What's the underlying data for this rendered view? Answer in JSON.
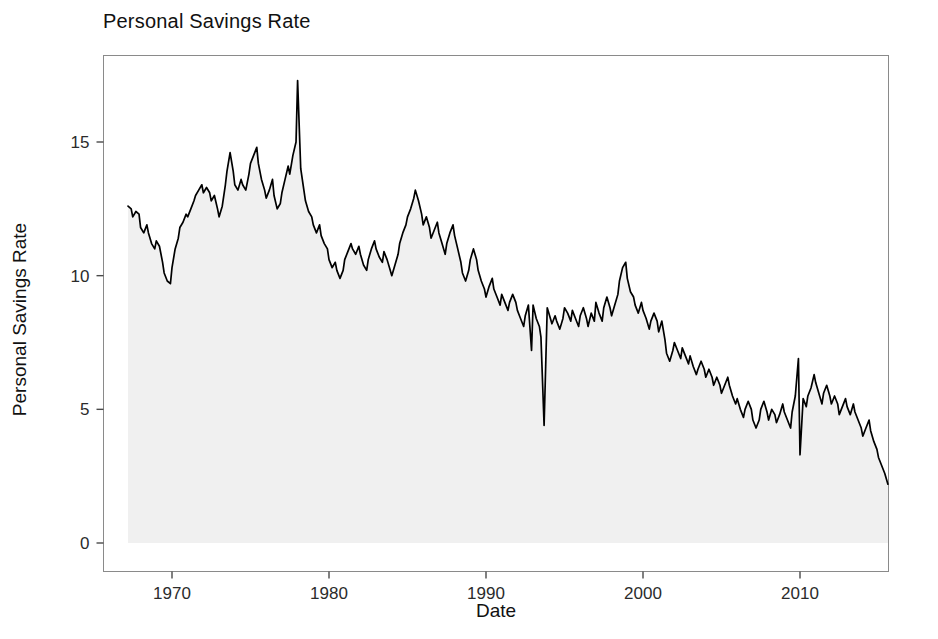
{
  "chart_data": {
    "type": "area",
    "title": "Personal Savings Rate",
    "xlabel": "Date",
    "ylabel": "Personal Savings Rate",
    "grid": false,
    "legend": null,
    "line_color": "#000000",
    "fill_color": "#f0f0f0",
    "xlim": [
      1966.0,
      2016.5
    ],
    "ylim": [
      0,
      17.8
    ],
    "xticks": [
      1970,
      1980,
      1990,
      2000,
      2010
    ],
    "xtick_labels": [
      "1970",
      "1980",
      "1990",
      "2000",
      "2010"
    ],
    "yticks": [
      0,
      5,
      10,
      15
    ],
    "ytick_labels": [
      "0",
      "5",
      "10",
      "15"
    ],
    "x_start": 1967.2,
    "x_end": 2015.6,
    "x": [
      1967.2,
      1967.4,
      1967.5,
      1967.7,
      1967.9,
      1968.0,
      1968.2,
      1968.4,
      1968.5,
      1968.7,
      1968.9,
      1969.0,
      1969.2,
      1969.4,
      1969.5,
      1969.7,
      1969.9,
      1970.0,
      1970.2,
      1970.4,
      1970.5,
      1970.7,
      1970.9,
      1971.0,
      1971.2,
      1971.4,
      1971.5,
      1971.7,
      1971.9,
      1972.0,
      1972.2,
      1972.4,
      1972.5,
      1972.7,
      1972.9,
      1973.0,
      1973.2,
      1973.4,
      1973.5,
      1973.7,
      1973.9,
      1974.0,
      1974.2,
      1974.4,
      1974.5,
      1974.7,
      1974.9,
      1975.0,
      1975.2,
      1975.4,
      1975.5,
      1975.7,
      1975.9,
      1976.0,
      1976.2,
      1976.4,
      1976.5,
      1976.7,
      1976.9,
      1977.0,
      1977.2,
      1977.4,
      1977.5,
      1977.7,
      1977.9,
      1978.0,
      1978.2,
      1978.4,
      1978.5,
      1978.7,
      1978.9,
      1979.0,
      1979.2,
      1979.4,
      1979.5,
      1979.7,
      1979.9,
      1980.0,
      1980.2,
      1980.4,
      1980.5,
      1980.7,
      1980.9,
      1981.0,
      1981.2,
      1981.4,
      1981.5,
      1981.7,
      1981.9,
      1982.0,
      1982.2,
      1982.4,
      1982.5,
      1982.7,
      1982.9,
      1983.0,
      1983.2,
      1983.4,
      1983.5,
      1983.7,
      1983.9,
      1984.0,
      1984.2,
      1984.4,
      1984.5,
      1984.7,
      1984.9,
      1985.0,
      1985.2,
      1985.4,
      1985.5,
      1985.7,
      1985.9,
      1986.0,
      1986.2,
      1986.4,
      1986.5,
      1986.7,
      1986.9,
      1987.0,
      1987.2,
      1987.4,
      1987.5,
      1987.7,
      1987.9,
      1988.0,
      1988.2,
      1988.4,
      1988.5,
      1988.7,
      1988.9,
      1989.0,
      1989.2,
      1989.4,
      1989.5,
      1989.7,
      1989.9,
      1990.0,
      1990.2,
      1990.4,
      1990.5,
      1990.7,
      1990.9,
      1991.0,
      1991.2,
      1991.4,
      1991.5,
      1991.7,
      1991.9,
      1992.0,
      1992.2,
      1992.4,
      1992.5,
      1992.7,
      1992.9,
      1993.0,
      1993.2,
      1993.4,
      1993.5,
      1993.7,
      1993.9,
      1994.0,
      1994.2,
      1994.4,
      1994.5,
      1994.7,
      1994.9,
      1995.0,
      1995.2,
      1995.4,
      1995.5,
      1995.7,
      1995.9,
      1996.0,
      1996.2,
      1996.4,
      1996.5,
      1996.7,
      1996.9,
      1997.0,
      1997.2,
      1997.4,
      1997.5,
      1997.7,
      1997.9,
      1998.0,
      1998.2,
      1998.4,
      1998.5,
      1998.7,
      1998.9,
      1999.0,
      1999.2,
      1999.4,
      1999.5,
      1999.7,
      1999.9,
      2000.0,
      2000.2,
      2000.4,
      2000.5,
      2000.7,
      2000.9,
      2001.0,
      2001.2,
      2001.4,
      2001.5,
      2001.7,
      2001.9,
      2002.0,
      2002.2,
      2002.4,
      2002.5,
      2002.7,
      2002.9,
      2003.0,
      2003.2,
      2003.4,
      2003.5,
      2003.7,
      2003.9,
      2004.0,
      2004.2,
      2004.4,
      2004.5,
      2004.7,
      2004.9,
      2005.0,
      2005.2,
      2005.4,
      2005.5,
      2005.7,
      2005.9,
      2006.0,
      2006.2,
      2006.4,
      2006.5,
      2006.7,
      2006.9,
      2007.0,
      2007.2,
      2007.4,
      2007.5,
      2007.7,
      2007.9,
      2008.0,
      2008.2,
      2008.4,
      2008.5,
      2008.7,
      2008.9,
      2009.0,
      2009.2,
      2009.4,
      2009.5,
      2009.7,
      2009.9,
      2010.0,
      2010.2,
      2010.4,
      2010.5,
      2010.7,
      2010.9,
      2011.0,
      2011.2,
      2011.4,
      2011.5,
      2011.7,
      2011.9,
      2012.0,
      2012.2,
      2012.4,
      2012.5,
      2012.7,
      2012.9,
      2013.0,
      2013.2,
      2013.4,
      2013.5,
      2013.7,
      2013.9,
      2014.0,
      2014.2,
      2014.4,
      2014.5,
      2014.7,
      2014.9,
      2015.0,
      2015.2,
      2015.4,
      2015.6
    ],
    "y": [
      12.6,
      12.5,
      12.2,
      12.4,
      12.3,
      11.8,
      11.6,
      11.9,
      11.6,
      11.2,
      11.0,
      11.3,
      11.1,
      10.5,
      10.1,
      9.8,
      9.7,
      10.3,
      11.0,
      11.4,
      11.8,
      12.0,
      12.3,
      12.2,
      12.5,
      12.8,
      13.0,
      13.2,
      13.4,
      13.1,
      13.3,
      13.1,
      12.8,
      13.0,
      12.5,
      12.2,
      12.6,
      13.4,
      13.9,
      14.6,
      13.9,
      13.4,
      13.2,
      13.6,
      13.4,
      13.2,
      13.8,
      14.2,
      14.5,
      14.8,
      14.2,
      13.6,
      13.2,
      12.9,
      13.2,
      13.6,
      13.0,
      12.5,
      12.7,
      13.1,
      13.6,
      14.1,
      13.8,
      14.5,
      15.0,
      17.3,
      14.0,
      13.2,
      12.8,
      12.4,
      12.2,
      11.9,
      11.6,
      11.9,
      11.5,
      11.2,
      11.0,
      10.6,
      10.3,
      10.5,
      10.2,
      9.9,
      10.2,
      10.6,
      10.9,
      11.2,
      11.0,
      10.8,
      11.1,
      10.8,
      10.4,
      10.2,
      10.6,
      11.0,
      11.3,
      11.0,
      10.7,
      10.5,
      10.9,
      10.6,
      10.2,
      10.0,
      10.4,
      10.8,
      11.2,
      11.6,
      11.9,
      12.2,
      12.5,
      12.9,
      13.2,
      12.8,
      12.3,
      11.9,
      12.2,
      11.8,
      11.4,
      11.7,
      12.0,
      11.6,
      11.2,
      10.8,
      11.2,
      11.6,
      11.9,
      11.5,
      11.0,
      10.5,
      10.1,
      9.8,
      10.2,
      10.6,
      11.0,
      10.6,
      10.2,
      9.8,
      9.5,
      9.2,
      9.6,
      9.9,
      9.5,
      9.2,
      8.9,
      9.3,
      9.0,
      8.7,
      9.0,
      9.3,
      9.0,
      8.7,
      8.4,
      8.1,
      8.5,
      8.9,
      7.2,
      8.9,
      8.4,
      8.1,
      7.7,
      4.4,
      8.8,
      8.6,
      8.2,
      8.5,
      8.3,
      8.0,
      8.4,
      8.8,
      8.6,
      8.3,
      8.7,
      8.4,
      8.1,
      8.5,
      8.8,
      8.4,
      8.1,
      8.6,
      8.3,
      9.0,
      8.6,
      8.3,
      8.8,
      9.2,
      8.8,
      8.5,
      8.9,
      9.3,
      9.8,
      10.3,
      10.5,
      9.9,
      9.4,
      9.2,
      8.9,
      8.6,
      9.0,
      8.7,
      8.4,
      8.0,
      8.3,
      8.6,
      8.3,
      7.9,
      8.3,
      7.6,
      7.1,
      6.8,
      7.2,
      7.5,
      7.2,
      6.9,
      7.3,
      7.0,
      6.7,
      7.0,
      6.6,
      6.3,
      6.5,
      6.8,
      6.5,
      6.2,
      6.5,
      6.2,
      5.9,
      6.2,
      5.9,
      5.6,
      5.9,
      6.2,
      5.9,
      5.5,
      5.2,
      5.4,
      5.0,
      4.7,
      5.0,
      5.3,
      5.0,
      4.6,
      4.3,
      4.6,
      5.0,
      5.3,
      4.9,
      4.6,
      5.0,
      4.8,
      4.5,
      4.8,
      5.2,
      4.9,
      4.6,
      4.3,
      4.9,
      5.5,
      6.9,
      3.3,
      5.4,
      5.1,
      5.5,
      5.8,
      6.3,
      6.0,
      5.6,
      5.2,
      5.6,
      5.9,
      5.5,
      5.2,
      5.5,
      5.2,
      4.8,
      5.1,
      5.4,
      5.1,
      4.8,
      5.2,
      4.9,
      4.6,
      4.3,
      4.0,
      4.3,
      4.6,
      4.2,
      3.8,
      3.5,
      3.2,
      2.9,
      2.6,
      2.2,
      6.7,
      3.6,
      3.3,
      3.6,
      3.9,
      3.6,
      3.3,
      3.6,
      3.9,
      4.2,
      3.9,
      3.6,
      3.3,
      3.6,
      3.9,
      3.5,
      3.2,
      3.5,
      3.8,
      3.5,
      3.2,
      3.5,
      3.8,
      4.1,
      3.8,
      3.5,
      3.8,
      4.1,
      3.8,
      3.5,
      3.9,
      4.3,
      4.8,
      5.3,
      7.7,
      4.9,
      5.4,
      5.9,
      5.5,
      6.3,
      6.8,
      7.2,
      6.8,
      8.1,
      6.4,
      6.9,
      6.6,
      6.2,
      5.9,
      6.3,
      6.6,
      6.2,
      5.9,
      6.3,
      6.0,
      5.7,
      6.1,
      6.4,
      6.7,
      7.0,
      6.6,
      6.3,
      6.7,
      7.1,
      6.8,
      7.2,
      7.5,
      7.2,
      6.8,
      7.1,
      7.4,
      7.8,
      8.2,
      8.6,
      11.9,
      5.6,
      6.4,
      6.1,
      5.8,
      6.2,
      6.6,
      6.3,
      6.0,
      6.4,
      6.8,
      7.1,
      6.8,
      6.5,
      6.9,
      7.2,
      6.9,
      6.6,
      7.0,
      7.3,
      7.6,
      7.3,
      7.0,
      7.4,
      7.6
    ]
  }
}
